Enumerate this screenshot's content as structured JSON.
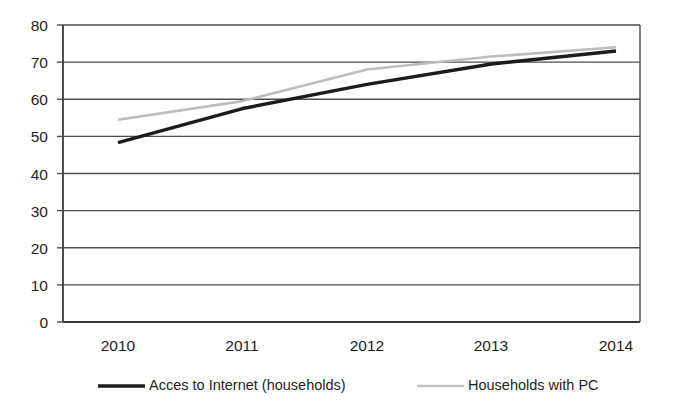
{
  "chart_data": {
    "type": "line",
    "title": "",
    "xlabel": "",
    "ylabel": "",
    "categories": [
      "2010",
      "2011",
      "2012",
      "2013",
      "2014"
    ],
    "x": [
      2010,
      2011,
      2012,
      2013,
      2014
    ],
    "ylim": [
      0,
      80
    ],
    "yticks": [
      0,
      10,
      20,
      30,
      40,
      50,
      60,
      70,
      80
    ],
    "ytick_labels": [
      "0",
      "10",
      "20",
      "30",
      "40",
      "50",
      "60",
      "70",
      "80"
    ],
    "grid": true,
    "legend_position": "bottom",
    "series": [
      {
        "name": "Acces to Internet (households)",
        "color": "#1b1b1b",
        "values": [
          48.3,
          57.5,
          64.0,
          69.5,
          73.0
        ]
      },
      {
        "name": "Households with PC",
        "color": "#bdbdbd",
        "values": [
          54.5,
          59.5,
          68.0,
          71.5,
          74.0
        ]
      }
    ]
  },
  "axes": {
    "y_tick_labels": [
      "80",
      "70",
      "60",
      "50",
      "40",
      "30",
      "20",
      "10",
      "0"
    ],
    "x_tick_labels": [
      "2010",
      "2011",
      "2012",
      "2013",
      "2014"
    ]
  },
  "legend": {
    "items": [
      {
        "label": "Acces to Internet (households)",
        "color": "#1b1b1b"
      },
      {
        "label": "Households with PC",
        "color": "#c2c2c2"
      }
    ]
  }
}
